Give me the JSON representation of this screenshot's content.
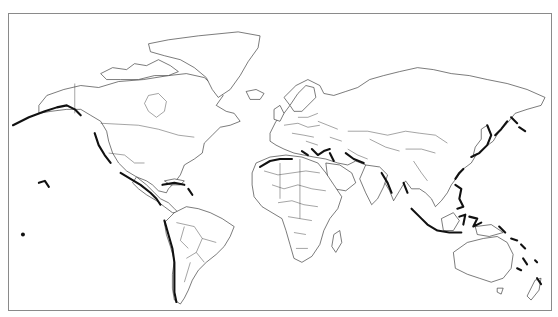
{
  "caption": {
    "text": "",
    "note": "partially cropped text line at top edge, not legible"
  },
  "map": {
    "projection": "world-mercator",
    "style": "black outline, white land and ocean",
    "frame_color": "#8a8a8a",
    "outline_color": "#222222",
    "highlight_color": "#111111",
    "highlight_meaning_visual": "thick black coastline segments",
    "highlighted_regions": [
      "Alaska / Aleutian coast",
      "US West Coast",
      "Mexico / Central America Pacific coast",
      "Caribbean (Cuba, Hispaniola, Puerto Rico)",
      "Andes Pacific coast (Peru, Chile)",
      "Hawaii",
      "North Africa / Mediterranean (Morocco, Algeria)",
      "Italy / Greece / Turkey",
      "Iran / Pakistan coast",
      "Bay of Bengal / Myanmar",
      "Kamchatka / Kuril Islands",
      "Japan",
      "Taiwan",
      "Philippines",
      "Indonesia (Sumatra, Java, Sulawesi, Moluccas)",
      "Papua New Guinea / Solomon Islands",
      "Vanuatu / Fiji / Tonga",
      "New Zealand"
    ]
  }
}
